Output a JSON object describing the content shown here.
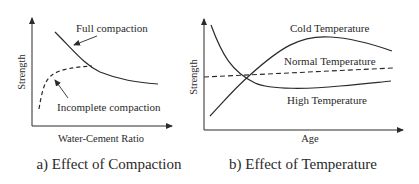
{
  "panels": [
    {
      "caption": "a) Effect of Compaction",
      "xlabel": "Water-Cement Ratio",
      "ylabel": "Strength",
      "curves": [
        {
          "label": "Full compaction",
          "style": "solid"
        },
        {
          "label": "Incomplete compaction",
          "style": "dashed"
        }
      ]
    },
    {
      "caption": "b) Effect of Temperature",
      "xlabel": "Age",
      "ylabel": "Strength",
      "curves": [
        {
          "label": "Cold Temperature",
          "style": "solid"
        },
        {
          "label": "Normal Temperature",
          "style": "dashed"
        },
        {
          "label": "High Temperature",
          "style": "solid"
        }
      ]
    }
  ],
  "colors": {
    "line": "#2a2a2a",
    "background": "#ffffff"
  }
}
